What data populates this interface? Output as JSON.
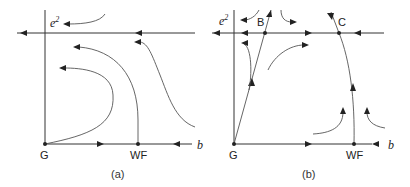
{
  "panels": [
    {
      "id": "a",
      "caption": "(a)",
      "axis_x_label": "b",
      "axis_y_label": "e",
      "axis_y_sup": "2",
      "points": [
        {
          "label": "G"
        },
        {
          "label": "WF"
        }
      ]
    },
    {
      "id": "b",
      "caption": "(b)",
      "axis_x_label": "b",
      "axis_y_label": "e",
      "axis_y_sup": "2",
      "points": [
        {
          "label": "G"
        },
        {
          "label": "WF"
        },
        {
          "label": "B"
        },
        {
          "label": "C"
        }
      ]
    }
  ]
}
